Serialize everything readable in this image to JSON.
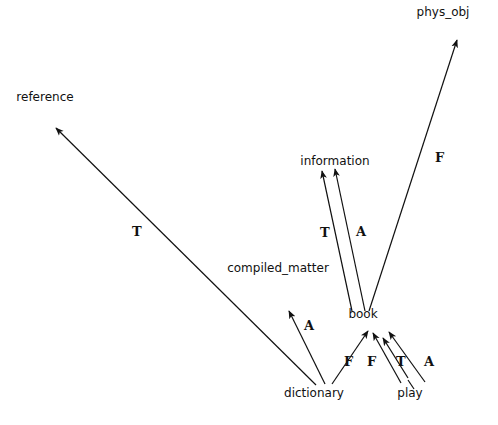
{
  "diagram": {
    "type": "directed-graph",
    "nodes": {
      "phys_obj": {
        "label": "phys_obj",
        "x": 443,
        "y": 16
      },
      "reference": {
        "label": "reference",
        "x": 45,
        "y": 101
      },
      "information": {
        "label": "information",
        "x": 335,
        "y": 165
      },
      "compiled_matter": {
        "label": "compiled_matter",
        "x": 278,
        "y": 272
      },
      "book": {
        "label": "book",
        "x": 363,
        "y": 318
      },
      "dictionary": {
        "label": "dictionary",
        "x": 314,
        "y": 397
      },
      "play": {
        "label": "play",
        "x": 410,
        "y": 397
      }
    },
    "edges": [
      {
        "from": "book",
        "to": "phys_obj",
        "label": "F"
      },
      {
        "from": "dictionary",
        "to": "reference",
        "label": "T"
      },
      {
        "from": "book",
        "to": "information",
        "label": "T"
      },
      {
        "from": "book",
        "to": "information",
        "label": "A"
      },
      {
        "from": "dictionary",
        "to": "compiled_matter",
        "label": "A"
      },
      {
        "from": "dictionary",
        "to": "book",
        "label": "F"
      },
      {
        "from": "play",
        "to": "book",
        "label": "F"
      },
      {
        "from": "play",
        "to": "book",
        "label": "T"
      },
      {
        "from": "play",
        "to": "book",
        "label": "A"
      }
    ]
  }
}
